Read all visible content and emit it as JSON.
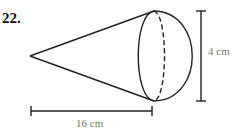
{
  "problem": {
    "number": "22."
  },
  "figure": {
    "dimensions": {
      "height_label": "4 cm",
      "length_label": "16 cm"
    },
    "colors": {
      "stroke": "#222222",
      "label": "#777777"
    }
  }
}
